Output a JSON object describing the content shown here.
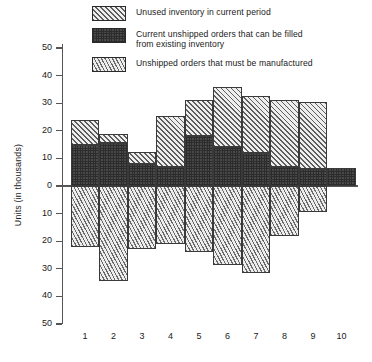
{
  "chart_data": {
    "type": "bar",
    "title": "",
    "xlabel": "",
    "ylabel": "Units (in thousands)",
    "categories": [
      "1",
      "2",
      "3",
      "4",
      "5",
      "6",
      "7",
      "8",
      "9",
      "10"
    ],
    "ylim": [
      -50,
      50
    ],
    "y_ticks": [
      50,
      40,
      30,
      20,
      10,
      0,
      10,
      20,
      30,
      40,
      50
    ],
    "y_tick_labels": [
      "50",
      "40",
      "30",
      "20",
      "10",
      "0",
      "10",
      "20",
      "30",
      "40",
      "50"
    ],
    "grid": false,
    "legend_position": "top",
    "stacked": true,
    "note": "Values above zero are split into two stacked segments; values below zero are a single segment.",
    "series": [
      {
        "name": "Unused inventory in current period",
        "pattern": "diagonal-hatch-light",
        "values": [
          9,
          3.5,
          4.5,
          18.5,
          13,
          22,
          20.5,
          24,
          24.5,
          0
        ]
      },
      {
        "name": "Current unshipped orders that can be filled from existing inventory",
        "pattern": "dark-checkerboard",
        "values": [
          15,
          15.5,
          8,
          7,
          18,
          14,
          12,
          7,
          6,
          6.5
        ]
      },
      {
        "name": "Unshipped orders that must be manufactured",
        "pattern": "steep-diagonal-hatch",
        "values": [
          -22,
          -34.5,
          -23,
          -21,
          -24,
          -28.5,
          -31.5,
          -18,
          -9.5,
          0
        ]
      }
    ],
    "bar_totals_positive": [
      24,
      19,
      12.5,
      25.5,
      31,
      36,
      32.5,
      31,
      30.5,
      6.5
    ]
  },
  "legend": {
    "items": [
      {
        "label": "Unused inventory in current period",
        "swatch": "diagonal-hatch-light"
      },
      {
        "label": "Current unshipped orders that can be filled\nfrom existing inventory",
        "swatch": "dark-checkerboard"
      },
      {
        "label": "Unshipped orders that must be manufactured",
        "swatch": "steep-diagonal-hatch"
      }
    ]
  },
  "colors": {
    "axis": "#555555",
    "outline": "#3a3a3a",
    "light_fill": "#e9e9e9",
    "dark_fill": "#4a4a4a",
    "text": "#1a1a1a"
  }
}
